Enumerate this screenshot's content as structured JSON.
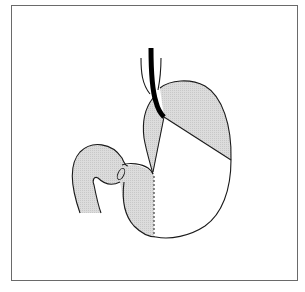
{
  "figure": {
    "frame_color": "#6a6a6a",
    "shade_color": "#d6d6d6",
    "line_color": "#1a1a1a",
    "regions": [
      {
        "name": "fundus-shaded",
        "shaded": true
      },
      {
        "name": "cardia-shaded",
        "shaded": true
      },
      {
        "name": "body-unshaded",
        "shaded": false
      },
      {
        "name": "antrum-shaded",
        "shaded": true
      },
      {
        "name": "duodenum-shaded",
        "shaded": true
      }
    ],
    "annotations": [
      {
        "name": "endoscope",
        "style": "thick black line"
      },
      {
        "name": "esophagus",
        "style": "thin outline"
      },
      {
        "name": "pylorus",
        "style": "small ellipse"
      },
      {
        "name": "antrum-boundary",
        "style": "dashed line"
      }
    ]
  }
}
